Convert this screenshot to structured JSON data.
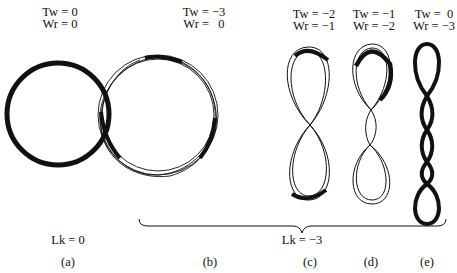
{
  "figure": {
    "panels": [
      {
        "id": "a",
        "tag": "(a)",
        "tw": "Tw = 0",
        "wr": "Wr = 0",
        "shape": "relaxed-circle"
      },
      {
        "id": "b",
        "tag": "(b)",
        "tw": "Tw = −3",
        "wr": "Wr =   0",
        "shape": "twisted-circle"
      },
      {
        "id": "c",
        "tag": "(c)",
        "tw": "Tw = −2",
        "wr": "Wr = −1",
        "shape": "figure-eight-1-crossing"
      },
      {
        "id": "d",
        "tag": "(d)",
        "tw": "Tw = −1",
        "wr": "Wr = −2",
        "shape": "figure-eight-2-crossings"
      },
      {
        "id": "e",
        "tag": "(e)",
        "tw": "Tw =  0",
        "wr": "Wr = −3",
        "shape": "supercoil-3-crossings"
      }
    ],
    "linking": [
      {
        "label": "Lk = 0",
        "group": "a"
      },
      {
        "label": "Lk = −3",
        "group": "b-e"
      }
    ],
    "colors": {
      "ink": "#111111",
      "background": "#ffffff"
    }
  }
}
